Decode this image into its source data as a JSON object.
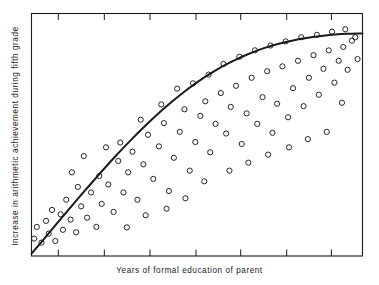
{
  "figure": {
    "background_color": "#ffffff",
    "ink_color": "#1a1a1a"
  },
  "chart_data": {
    "type": "scatter",
    "title": "",
    "xlabel": "Years of formal education of parent",
    "ylabel": "Increase in arithmetic achievement during fifth grade",
    "xlim": [
      0,
      1
    ],
    "ylim": [
      0,
      1
    ],
    "grid": false,
    "legend": null,
    "axis_style": {
      "frame": "box",
      "tick_direction": "in",
      "x_tick_count": 7,
      "x_tick_positions": [
        0.081,
        0.22,
        0.358,
        0.497,
        0.632,
        0.771,
        0.906
      ],
      "y_tick_count": 0,
      "tick_labels_shown": false
    },
    "marker": {
      "style": "open-circle",
      "size_px": 5.2,
      "edge_color": "#1a1a1a",
      "fill": "none"
    },
    "points": [
      [
        0.008,
        0.072
      ],
      [
        0.03,
        0.055
      ],
      [
        0.052,
        0.092
      ],
      [
        0.016,
        0.12
      ],
      [
        0.044,
        0.145
      ],
      [
        0.072,
        0.062
      ],
      [
        0.095,
        0.108
      ],
      [
        0.062,
        0.19
      ],
      [
        0.088,
        0.172
      ],
      [
        0.118,
        0.15
      ],
      [
        0.105,
        0.232
      ],
      [
        0.135,
        0.098
      ],
      [
        0.15,
        0.205
      ],
      [
        0.168,
        0.158
      ],
      [
        0.14,
        0.285
      ],
      [
        0.18,
        0.262
      ],
      [
        0.196,
        0.12
      ],
      [
        0.212,
        0.215
      ],
      [
        0.205,
        0.33
      ],
      [
        0.232,
        0.295
      ],
      [
        0.248,
        0.182
      ],
      [
        0.262,
        0.392
      ],
      [
        0.278,
        0.262
      ],
      [
        0.292,
        0.345
      ],
      [
        0.268,
        0.468
      ],
      [
        0.305,
        0.43
      ],
      [
        0.32,
        0.232
      ],
      [
        0.338,
        0.378
      ],
      [
        0.352,
        0.5
      ],
      [
        0.33,
        0.562
      ],
      [
        0.368,
        0.318
      ],
      [
        0.385,
        0.452
      ],
      [
        0.4,
        0.548
      ],
      [
        0.415,
        0.268
      ],
      [
        0.392,
        0.625
      ],
      [
        0.43,
        0.405
      ],
      [
        0.448,
        0.512
      ],
      [
        0.462,
        0.605
      ],
      [
        0.44,
        0.69
      ],
      [
        0.478,
        0.352
      ],
      [
        0.495,
        0.47
      ],
      [
        0.51,
        0.578
      ],
      [
        0.488,
        0.712
      ],
      [
        0.525,
        0.638
      ],
      [
        0.54,
        0.428
      ],
      [
        0.556,
        0.545
      ],
      [
        0.535,
        0.748
      ],
      [
        0.572,
        0.672
      ],
      [
        0.588,
        0.505
      ],
      [
        0.602,
        0.615
      ],
      [
        0.58,
        0.792
      ],
      [
        0.618,
        0.702
      ],
      [
        0.635,
        0.462
      ],
      [
        0.65,
        0.588
      ],
      [
        0.628,
        0.822
      ],
      [
        0.665,
        0.735
      ],
      [
        0.682,
        0.545
      ],
      [
        0.698,
        0.655
      ],
      [
        0.675,
        0.848
      ],
      [
        0.712,
        0.762
      ],
      [
        0.728,
        0.508
      ],
      [
        0.742,
        0.628
      ],
      [
        0.722,
        0.868
      ],
      [
        0.758,
        0.782
      ],
      [
        0.775,
        0.572
      ],
      [
        0.79,
        0.692
      ],
      [
        0.768,
        0.885
      ],
      [
        0.805,
        0.805
      ],
      [
        0.822,
        0.618
      ],
      [
        0.838,
        0.735
      ],
      [
        0.815,
        0.902
      ],
      [
        0.852,
        0.828
      ],
      [
        0.868,
        0.665
      ],
      [
        0.882,
        0.772
      ],
      [
        0.862,
        0.912
      ],
      [
        0.898,
        0.848
      ],
      [
        0.915,
        0.715
      ],
      [
        0.928,
        0.805
      ],
      [
        0.908,
        0.925
      ],
      [
        0.942,
        0.862
      ],
      [
        0.955,
        0.768
      ],
      [
        0.968,
        0.888
      ],
      [
        0.948,
        0.935
      ],
      [
        0.978,
        0.902
      ],
      [
        0.122,
        0.345
      ],
      [
        0.158,
        0.412
      ],
      [
        0.225,
        0.448
      ],
      [
        0.288,
        0.118
      ],
      [
        0.345,
        0.168
      ],
      [
        0.408,
        0.195
      ],
      [
        0.465,
        0.238
      ],
      [
        0.522,
        0.308
      ],
      [
        0.598,
        0.352
      ],
      [
        0.655,
        0.385
      ],
      [
        0.715,
        0.418
      ],
      [
        0.778,
        0.448
      ],
      [
        0.835,
        0.482
      ],
      [
        0.892,
        0.512
      ],
      [
        0.938,
        0.632
      ],
      [
        0.985,
        0.812
      ]
    ],
    "fit_curve": {
      "description": "smooth concave increasing trend line (diminishing returns)",
      "stroke_color": "#1a1a1a",
      "stroke_width_px": 2.0,
      "points": [
        [
          0.0,
          0.01
        ],
        [
          0.05,
          0.09
        ],
        [
          0.1,
          0.172
        ],
        [
          0.15,
          0.252
        ],
        [
          0.2,
          0.33
        ],
        [
          0.25,
          0.406
        ],
        [
          0.3,
          0.478
        ],
        [
          0.35,
          0.545
        ],
        [
          0.4,
          0.608
        ],
        [
          0.45,
          0.665
        ],
        [
          0.5,
          0.716
        ],
        [
          0.55,
          0.76
        ],
        [
          0.6,
          0.798
        ],
        [
          0.65,
          0.83
        ],
        [
          0.7,
          0.856
        ],
        [
          0.75,
          0.876
        ],
        [
          0.8,
          0.892
        ],
        [
          0.85,
          0.903
        ],
        [
          0.9,
          0.911
        ],
        [
          0.95,
          0.916
        ],
        [
          1.0,
          0.918
        ]
      ]
    }
  }
}
